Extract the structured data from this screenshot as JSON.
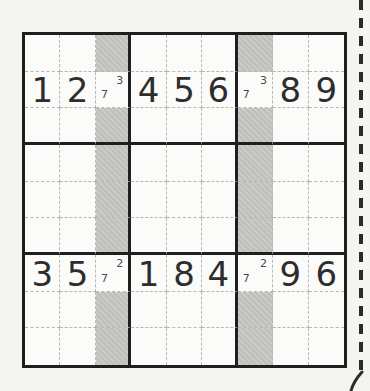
{
  "page": {
    "background": "#f4f4f1"
  },
  "puzzle": {
    "type": "sudoku",
    "size": 9,
    "rows": [
      [
        "",
        "",
        "",
        "",
        "",
        "",
        "",
        "",
        ""
      ],
      [
        "1",
        "2",
        "",
        "4",
        "5",
        "6",
        "",
        "8",
        "9"
      ],
      [
        "",
        "",
        "",
        "",
        "",
        "",
        "",
        "",
        ""
      ],
      [
        "",
        "",
        "",
        "",
        "",
        "",
        "",
        "",
        ""
      ],
      [
        "",
        "",
        "",
        "",
        "",
        "",
        "",
        "",
        ""
      ],
      [
        "",
        "",
        "",
        "",
        "",
        "",
        "",
        "",
        ""
      ],
      [
        "3",
        "5",
        "",
        "1",
        "8",
        "4",
        "",
        "9",
        "6"
      ],
      [
        "",
        "",
        "",
        "",
        "",
        "",
        "",
        "",
        ""
      ],
      [
        "",
        "",
        "",
        "",
        "",
        "",
        "",
        "",
        ""
      ]
    ],
    "candidates": [
      {
        "row": 1,
        "col": 2,
        "marks": [
          {
            "digit": "3",
            "pos": "top-right"
          },
          {
            "digit": "7",
            "pos": "bottom-left"
          }
        ]
      },
      {
        "row": 1,
        "col": 6,
        "marks": [
          {
            "digit": "3",
            "pos": "top-right"
          },
          {
            "digit": "7",
            "pos": "bottom-left"
          }
        ]
      },
      {
        "row": 6,
        "col": 2,
        "marks": [
          {
            "digit": "2",
            "pos": "top-right"
          },
          {
            "digit": "7",
            "pos": "bottom-left"
          }
        ]
      },
      {
        "row": 6,
        "col": 6,
        "marks": [
          {
            "digit": "2",
            "pos": "top-right"
          },
          {
            "digit": "7",
            "pos": "bottom-left"
          }
        ]
      }
    ],
    "shaded_columns": [
      2,
      6
    ],
    "unshaded_rows_in_shaded_columns": [
      1,
      6
    ],
    "colors": {
      "shade": "#c8c8c5",
      "grid_line_minor": "#b8b8b2",
      "grid_line_major": "#1f1f1f",
      "digit": "#2d2d2d",
      "candidate": "#4a4a4a",
      "cell_bg": "#fbfbf9"
    }
  },
  "page_edge": {
    "cut_line_color": "#2b2b2b"
  }
}
